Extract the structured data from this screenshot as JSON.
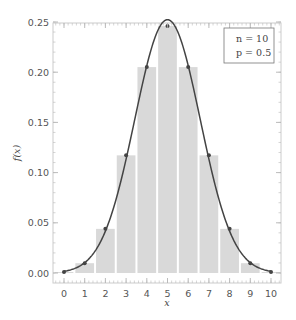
{
  "chart_data": {
    "type": "bar",
    "title": "",
    "xlabel": "x",
    "ylabel": "f(x)",
    "xlim": [
      -0.5,
      10.5
    ],
    "ylim": [
      0,
      0.25
    ],
    "x": [
      0,
      1,
      2,
      3,
      4,
      5,
      6,
      7,
      8,
      9,
      10
    ],
    "values": [
      0.00098,
      0.00977,
      0.04395,
      0.11719,
      0.20508,
      0.24609,
      0.20508,
      0.11719,
      0.04395,
      0.00977,
      0.00098
    ],
    "xticks": [
      "0",
      "1",
      "2",
      "3",
      "4",
      "5",
      "6",
      "7",
      "8",
      "9",
      "10"
    ],
    "yticks": [
      "0.00",
      "0.05",
      "0.10",
      "0.15",
      "0.20",
      "0.25"
    ],
    "ytick_values": [
      0,
      0.05,
      0.1,
      0.15,
      0.2,
      0.25
    ],
    "series": [
      {
        "name": "pmf bars",
        "kind": "bar",
        "values": [
          0.00098,
          0.00977,
          0.04395,
          0.11719,
          0.20508,
          0.24609,
          0.20508,
          0.11719,
          0.04395,
          0.00977,
          0.00098
        ]
      },
      {
        "name": "normal approximation curve",
        "kind": "line",
        "mean": 5,
        "sd": 1.5811
      }
    ],
    "legend": {
      "position": "top-right",
      "lines": [
        "n = 10",
        "p = 0.5"
      ]
    },
    "grid": false,
    "colors": {
      "bar": "#d9d9d9",
      "curve": "#444444",
      "frame": "#cccccc",
      "text": "#555555"
    }
  }
}
